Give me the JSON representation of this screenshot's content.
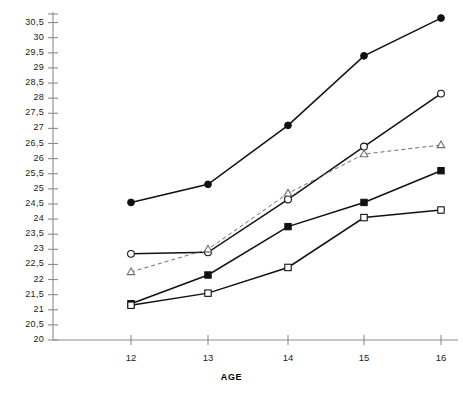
{
  "chart_data": {
    "type": "line",
    "title": "",
    "subtitle": "",
    "xlabel": "AGE",
    "ylabel": "",
    "x": [
      12,
      13,
      14,
      15,
      16
    ],
    "categories": [
      "12",
      "13",
      "14",
      "15",
      "16"
    ],
    "xlim": [
      11.6,
      16.25
    ],
    "ylim": [
      20,
      30.85
    ],
    "grid": false,
    "legend": "none",
    "y_decimal_separator": ",",
    "y_tick_labels": [
      "30,5",
      "30",
      "29,5",
      "29",
      "28,5",
      "28",
      "27,5",
      "27",
      "26,5",
      "26",
      "25,5",
      "25",
      "24,5",
      "24",
      "23,5",
      "23",
      "22,5",
      "22",
      "21,5",
      "21",
      "20,5",
      "20"
    ],
    "y_tick_values": [
      30.5,
      30,
      29.5,
      29,
      28.5,
      28,
      27.5,
      27,
      26.5,
      26,
      25.5,
      25,
      24.5,
      24,
      23.5,
      23,
      22.5,
      22,
      21.5,
      21,
      20.5,
      20
    ],
    "x_tick_labels": [
      "12",
      "13",
      "14",
      "15",
      "16"
    ],
    "series": [
      {
        "name": "series-filled-circle",
        "marker": "filled-circle",
        "linestyle": "solid",
        "color": "#111111",
        "values": [
          24.55,
          25.15,
          27.1,
          29.4,
          30.65
        ]
      },
      {
        "name": "series-open-circle",
        "marker": "open-circle",
        "linestyle": "solid",
        "color": "#111111",
        "values": [
          22.85,
          22.9,
          24.65,
          26.4,
          28.15
        ]
      },
      {
        "name": "series-open-triangle",
        "marker": "open-triangle",
        "linestyle": "dashed",
        "color": "#6d6d6d",
        "values": [
          22.25,
          23.0,
          24.85,
          26.15,
          26.45
        ]
      },
      {
        "name": "series-filled-square",
        "marker": "filled-square",
        "linestyle": "solid",
        "color": "#111111",
        "values": [
          21.2,
          22.15,
          23.75,
          24.55,
          25.6
        ]
      },
      {
        "name": "series-open-square",
        "marker": "open-square",
        "linestyle": "solid",
        "color": "#111111",
        "values": [
          21.15,
          21.55,
          22.4,
          24.05,
          24.3
        ]
      }
    ]
  },
  "colors": {
    "axis": "#8c8c8c",
    "ink": "#111111",
    "dashed": "#6d6d6d",
    "background": "#ffffff"
  }
}
